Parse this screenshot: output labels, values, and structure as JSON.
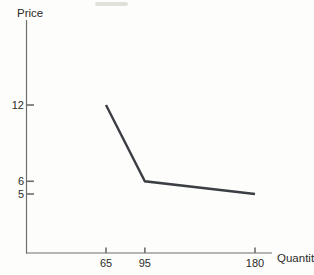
{
  "figure": {
    "background": "#fdfdfb",
    "scan_artifact": "smudge-top-edge"
  },
  "chart_data": {
    "type": "line",
    "title": "",
    "xlabel": "Quantity",
    "ylabel": "Price",
    "x_ticks": [
      65,
      95,
      180
    ],
    "y_ticks": [
      12,
      6,
      5
    ],
    "xlim": [
      0,
      195
    ],
    "ylim": [
      0,
      14
    ],
    "grid": false,
    "legend": "none",
    "series": [
      {
        "name": "kinked-demand-curve",
        "points": [
          [
            65,
            12
          ],
          [
            95,
            6
          ],
          [
            180,
            5
          ]
        ]
      }
    ],
    "colors": {
      "curve": "#3b3e43",
      "axis": "#6e6e6a",
      "text": "#2b2b28",
      "smudge": "#d9d9d5"
    }
  }
}
